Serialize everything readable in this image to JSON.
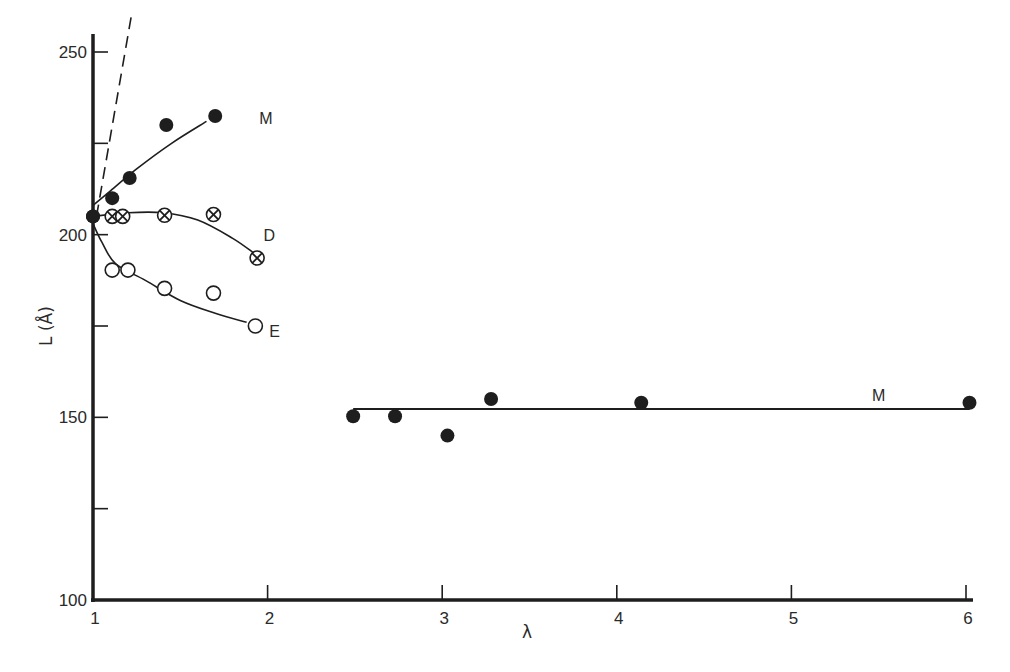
{
  "chart_data": {
    "type": "scatter",
    "title": "",
    "xlabel": "λ",
    "ylabel": "L (Å)",
    "xlim": [
      1,
      6
    ],
    "ylim": [
      100,
      250
    ],
    "x_ticks": [
      1,
      2,
      3,
      4,
      5,
      6
    ],
    "y_ticks": [
      100,
      125,
      150,
      175,
      200,
      225,
      250
    ],
    "y_tick_labels": [
      {
        "value": 100,
        "label": "100"
      },
      {
        "value": 150,
        "label": "150"
      },
      {
        "value": 200,
        "label": "200"
      },
      {
        "value": 250,
        "label": "250"
      }
    ],
    "grid": false,
    "series": [
      {
        "name": "M",
        "marker": "filled-circle",
        "points": [
          [
            1.0,
            205
          ],
          [
            1.11,
            210
          ],
          [
            1.21,
            215.5
          ],
          [
            1.42,
            230
          ],
          [
            1.7,
            232.5
          ]
        ],
        "curve": [
          [
            1.0,
            208
          ],
          [
            1.1,
            212
          ],
          [
            1.25,
            218
          ],
          [
            1.45,
            225
          ],
          [
            1.65,
            231
          ]
        ],
        "label_pos": [
          1.99,
          232
        ]
      },
      {
        "name": "D",
        "marker": "crossed-circle",
        "points": [
          [
            1.11,
            205
          ],
          [
            1.17,
            205
          ],
          [
            1.41,
            205.3
          ],
          [
            1.69,
            205.5
          ],
          [
            1.94,
            193.6
          ]
        ],
        "curve": [
          [
            1.0,
            205
          ],
          [
            1.2,
            206
          ],
          [
            1.4,
            206
          ],
          [
            1.6,
            204
          ],
          [
            1.8,
            199
          ],
          [
            1.92,
            195
          ]
        ],
        "label_pos": [
          2.01,
          200
        ]
      },
      {
        "name": "E",
        "marker": "open-circle",
        "points": [
          [
            1.11,
            190.3
          ],
          [
            1.2,
            190.3
          ],
          [
            1.41,
            185.3
          ],
          [
            1.69,
            184
          ],
          [
            1.93,
            175
          ]
        ],
        "curve": [
          [
            1.0,
            203
          ],
          [
            1.05,
            198
          ],
          [
            1.13,
            192
          ],
          [
            1.3,
            187.5
          ],
          [
            1.5,
            182
          ],
          [
            1.7,
            178.5
          ],
          [
            1.88,
            176
          ]
        ],
        "label_pos": [
          2.04,
          173.5
        ]
      },
      {
        "name": "M",
        "marker": "filled-circle",
        "points": [
          [
            2.49,
            150.3
          ],
          [
            2.73,
            150.3
          ],
          [
            3.03,
            145
          ],
          [
            3.28,
            155
          ],
          [
            4.14,
            154
          ],
          [
            6.02,
            154
          ]
        ],
        "fit_line": {
          "from": [
            2.49,
            152.3
          ],
          "to": [
            6.02,
            152.3
          ]
        },
        "label_pos": [
          5.5,
          156
        ]
      }
    ],
    "reference_line": {
      "style": "dashed",
      "from": [
        1.02,
        205
      ],
      "to": [
        1.22,
        260
      ]
    }
  }
}
